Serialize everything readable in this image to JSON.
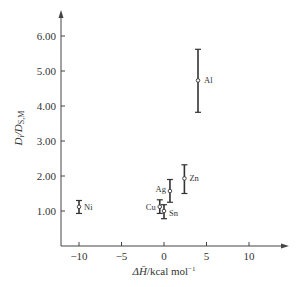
{
  "chart_data": {
    "type": "scatter",
    "title": "",
    "xlabel": "ΔH̄ /kcal mol⁻¹",
    "ylabel": "D_i/D_S,M",
    "xlim": [
      -12,
      14
    ],
    "ylim": [
      0,
      6.6
    ],
    "x_ticks": [
      -10,
      -5,
      0,
      5,
      10
    ],
    "x_tick_labels": [
      "−10",
      "−5",
      "0",
      "5",
      "10"
    ],
    "y_ticks": [
      1,
      2,
      3,
      4,
      5,
      6
    ],
    "y_tick_labels": [
      "1.00",
      "2.00",
      "3.00",
      "4.00",
      "5.00",
      "6.00"
    ],
    "grid": false,
    "legend": null,
    "points": [
      {
        "label": "Ni",
        "x": -10,
        "y": 1.12,
        "y_low": 0.93,
        "y_high": 1.3
      },
      {
        "label": "Cu",
        "x": -0.5,
        "y": 1.12,
        "y_low": 0.93,
        "y_high": 1.32
      },
      {
        "label": "Sn",
        "x": 0,
        "y": 1.0,
        "y_low": 0.78,
        "y_high": 1.18
      },
      {
        "label": "Ag",
        "x": 0.7,
        "y": 1.57,
        "y_low": 1.25,
        "y_high": 1.9
      },
      {
        "label": "Zn",
        "x": 2.4,
        "y": 1.93,
        "y_low": 1.5,
        "y_high": 2.32
      },
      {
        "label": "Al",
        "x": 4.0,
        "y": 4.73,
        "y_low": 3.82,
        "y_high": 5.62
      }
    ]
  },
  "labels": {
    "xlabel_main": "ΔH̄",
    "xlabel_unit": "/kcal mol",
    "xlabel_exp": "−1",
    "ylabel_D": "D",
    "ylabel_i": "i",
    "ylabel_slash": "/D",
    "ylabel_sub": "S,M"
  }
}
